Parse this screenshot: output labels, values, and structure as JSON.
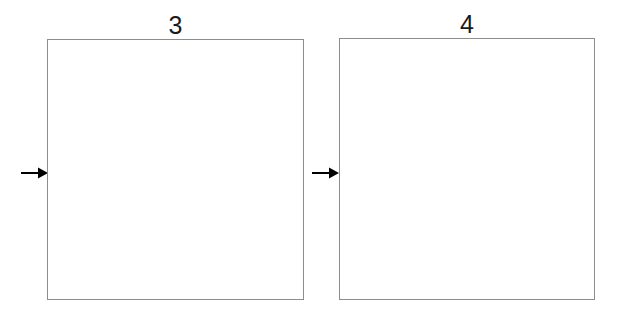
{
  "figure": {
    "background_color": "#ffffff",
    "width": 618,
    "height": 314,
    "panels": [
      {
        "label": "3",
        "fill_color": "#ffffff",
        "border_color": "#8d8d8d",
        "content": "",
        "arrow": {
          "icon": "arrow-right-icon",
          "glyph": "→",
          "color": "#000000",
          "points_to": "3"
        }
      },
      {
        "label": "4",
        "fill_color": "#ffffff",
        "border_color": "#8d8d8d",
        "content": "",
        "arrow": {
          "icon": "arrow-right-icon",
          "glyph": "→",
          "color": "#000000",
          "points_to": "4"
        }
      }
    ]
  }
}
